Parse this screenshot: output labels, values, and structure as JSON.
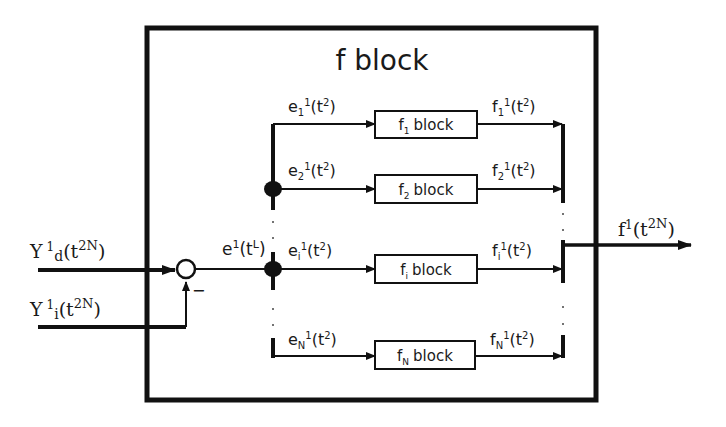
{
  "diagram": {
    "title": "f block",
    "inputs": {
      "desired": {
        "base": "Y",
        "sup": "1",
        "sub": "d",
        "arg": "(t",
        "arg_sup": "2N",
        "close": ")"
      },
      "inner": {
        "base": "Y",
        "sup": "1",
        "sub": "i",
        "arg": "(t",
        "arg_sup": "2N",
        "close": ")"
      }
    },
    "summing_junction": {
      "minus_sign": "−"
    },
    "error_signal": {
      "base": "e",
      "sup": "1",
      "arg": "(t",
      "arg_sup": "L",
      "close": ")"
    },
    "output": {
      "base": "f",
      "sup": "1",
      "arg": "(t",
      "arg_sup": "2N",
      "close": ")"
    },
    "branches": [
      {
        "in_base": "e",
        "in_sub": "1",
        "in_sup": "1",
        "block_base": "f",
        "block_sub": "1",
        "block_word": "block",
        "out_base": "f",
        "out_sub": "1",
        "out_sup": "1",
        "arg": "(t",
        "arg_sup": "2",
        "close": ")"
      },
      {
        "in_base": "e",
        "in_sub": "2",
        "in_sup": "1",
        "block_base": "f",
        "block_sub": "2",
        "block_word": "block",
        "out_base": "f",
        "out_sub": "2",
        "out_sup": "1",
        "arg": "(t",
        "arg_sup": "2",
        "close": ")"
      },
      {
        "in_base": "e",
        "in_sub": "i",
        "in_sup": "1",
        "block_base": "f",
        "block_sub": "i",
        "block_word": "block",
        "out_base": "f",
        "out_sub": "i",
        "out_sup": "1",
        "arg": "(t",
        "arg_sup": "2",
        "close": ")"
      },
      {
        "in_base": "e",
        "in_sub": "N",
        "in_sup": "1",
        "block_base": "f",
        "block_sub": "N",
        "block_word": "block",
        "out_base": "f",
        "out_sub": "N",
        "out_sup": "1",
        "arg": "(t",
        "arg_sup": "2",
        "close": ")"
      }
    ],
    "colors": {
      "stroke": "#111111",
      "background": "#ffffff"
    }
  }
}
